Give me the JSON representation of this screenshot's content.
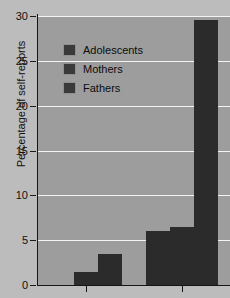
{
  "chart_data": {
    "type": "bar",
    "title": "",
    "xlabel": "",
    "ylabel": "Percentage of self-reports",
    "ylim": [
      0,
      30
    ],
    "yticks": [
      0,
      5,
      10,
      15,
      20,
      25,
      30
    ],
    "ytick_labels": [
      "0",
      "5",
      "10",
      "15",
      "20",
      "25",
      "30"
    ],
    "grid": true,
    "grid_axis": "y",
    "legend_position": "upper left inside plot",
    "categories": [
      "Group 1",
      "Group 2"
    ],
    "series": [
      {
        "name": "Adolescents",
        "values": [
          0,
          6.0
        ],
        "color": "#2b2b2b"
      },
      {
        "name": "Mothers",
        "values": [
          1.5,
          6.5
        ],
        "color": "#2b2b2b"
      },
      {
        "name": "Fathers",
        "values": [
          3.5,
          29.5
        ],
        "color": "#2b2b2b"
      }
    ],
    "bar_color": "#2b2b2b",
    "plot_background": "#9d9d9d",
    "figure_background": "#bcbcbc",
    "gridline_color": "#f2f2f2",
    "axis_color": "#161616"
  },
  "legend": {
    "items": [
      {
        "label": "Adolescents",
        "swatch_name": "legend-swatch-adolescents"
      },
      {
        "label": "Mothers",
        "swatch_name": "legend-swatch-mothers"
      },
      {
        "label": "Fathers",
        "swatch_name": "legend-swatch-fathers"
      }
    ]
  }
}
